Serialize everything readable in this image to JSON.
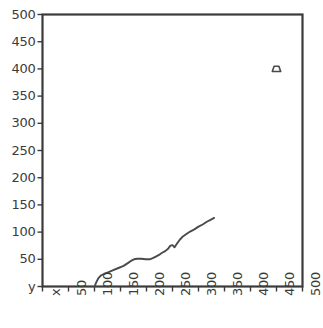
{
  "chart_data": {
    "type": "line",
    "title": "",
    "xlabel": "x",
    "ylabel": "y",
    "xlim": [
      0,
      500
    ],
    "ylim": [
      0,
      500
    ],
    "grid": false,
    "legend": null,
    "x_ticks": [
      0,
      50,
      100,
      150,
      200,
      250,
      300,
      350,
      400,
      450,
      500
    ],
    "y_ticks": [
      0,
      50,
      100,
      150,
      200,
      250,
      300,
      350,
      400,
      450,
      500
    ],
    "x_tick_labels": [
      "x",
      "50",
      "100",
      "150",
      "200",
      "250",
      "300",
      "350",
      "400",
      "450",
      "500"
    ],
    "y_tick_labels": [
      "y",
      "50",
      "100",
      "150",
      "200",
      "250",
      "300",
      "350",
      "400",
      "450",
      "500"
    ],
    "series": [
      {
        "name": "curve",
        "type": "line",
        "color": "#4a4a4a",
        "x": [
          100,
          104,
          108,
          112,
          118,
          126,
          136,
          146,
          156,
          164,
          170,
          176,
          182,
          190,
          198,
          206,
          212,
          218,
          224,
          230,
          236,
          242,
          246,
          250,
          254,
          258,
          264,
          270,
          276,
          284,
          292,
          300,
          308,
          316,
          324,
          330
        ],
        "y": [
          0,
          9,
          16,
          20,
          23,
          26,
          30,
          34,
          38,
          43,
          47,
          50,
          51,
          51,
          50,
          50,
          52,
          55,
          58,
          62,
          65,
          70,
          75,
          76,
          72,
          78,
          86,
          92,
          96,
          101,
          105,
          110,
          114,
          119,
          123,
          126
        ]
      },
      {
        "name": "marker",
        "type": "scatter",
        "color": "#4a4a4a",
        "marker": "trapezoid",
        "x": [
          450
        ],
        "y": [
          400
        ]
      }
    ]
  },
  "axes": {
    "frame_color": "#3b3b3b",
    "line_color": "#4a4a4a",
    "text_color": "#3b3b3b"
  }
}
